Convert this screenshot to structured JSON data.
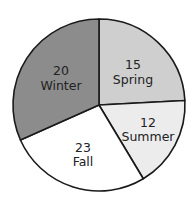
{
  "chart_data": {
    "type": "pie",
    "title": "",
    "categories": [
      "Spring",
      "Summer",
      "Fall",
      "Winter"
    ],
    "values": [
      15,
      12,
      23,
      20
    ],
    "slices": [
      {
        "label": "Spring",
        "value": 15,
        "value_text": "15",
        "color": "#cfcfcf",
        "start_deg": 0,
        "end_deg": 87,
        "label_x": 133,
        "label_y1": 69,
        "label_y2": 84
      },
      {
        "label": "Summer",
        "value": 12,
        "value_text": "12",
        "color": "#ececec",
        "start_deg": 87,
        "end_deg": 149,
        "label_x": 148,
        "label_y1": 127,
        "label_y2": 141
      },
      {
        "label": "Fall",
        "value": 23,
        "value_text": "23",
        "color": "#ffffff",
        "start_deg": 149,
        "end_deg": 246,
        "label_x": 83,
        "label_y1": 152,
        "label_y2": 166
      },
      {
        "label": "Winter",
        "value": 20,
        "value_text": "20",
        "color": "#8c8c8c",
        "start_deg": 246,
        "end_deg": 360,
        "label_x": 61,
        "label_y1": 75,
        "label_y2": 90
      }
    ],
    "center": [
      99,
      105
    ],
    "radius": 86,
    "stroke_color": "#1a1a1a",
    "legend": "none"
  }
}
